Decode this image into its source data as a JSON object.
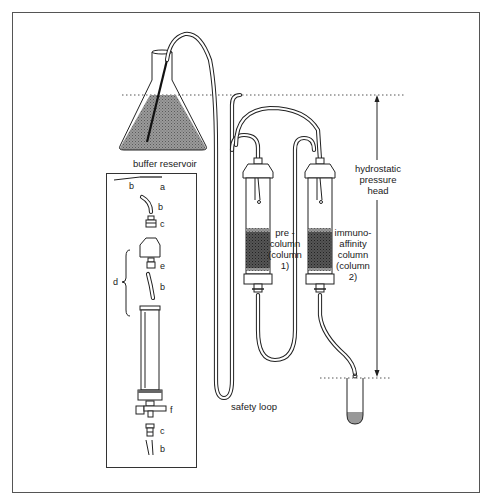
{
  "diagram": {
    "type": "apparatus-schematic",
    "colors": {
      "line": "#222222",
      "fill_gray": "#8a8a8a",
      "frame": "#555555",
      "background": "#ffffff"
    },
    "labels": {
      "buffer_reservoir": "buffer reservoir",
      "precolumn": [
        "pre -",
        "column",
        "(column",
        "1)"
      ],
      "immunoaffinity": [
        "immuno-",
        "affinity",
        "column",
        "(column",
        "2)"
      ],
      "pressure_head": [
        "hydrostatic",
        "pressure",
        "head"
      ],
      "safety_loop": "safety loop"
    },
    "inset": {
      "parts": {
        "a": "a",
        "b_needle": "b",
        "b_tube_top": "b",
        "c_top": "c",
        "d": "d",
        "e": "e",
        "b_tube_mid": "b",
        "f": "f",
        "c_bottom": "c",
        "b_tube_bottom": "b"
      }
    }
  }
}
